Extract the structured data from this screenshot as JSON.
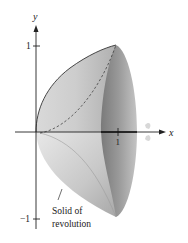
{
  "figure": {
    "axes": {
      "x_label": "x",
      "y_label": "y",
      "x_tick_label": "1",
      "y_tick_top_label": "1",
      "y_tick_bottom_label": "−1"
    },
    "annotation": {
      "line1": "Solid of",
      "line2": "revolution"
    },
    "colors": {
      "surface_light": "#e2e2e2",
      "surface_mid": "#bcbcbc",
      "surface_dark": "#8a8a8a",
      "axis": "#222222",
      "rotation_arrow": "#d6d6d6"
    }
  }
}
